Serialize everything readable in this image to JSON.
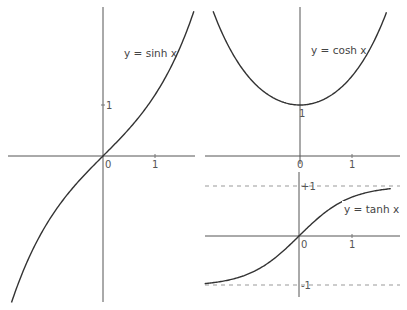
{
  "panels": {
    "sinh": {
      "label": "y = sinh x",
      "origin_label": "0",
      "x_tick_label": "1",
      "y_tick_label": "1",
      "curve_color": "#333333"
    },
    "cosh": {
      "label": "y = cosh x",
      "origin_label": "0",
      "x_tick_label": "1",
      "y_tick_label": "1",
      "curve_color": "#333333"
    },
    "tanh": {
      "label": "y = tanh x",
      "origin_label": "0",
      "x_tick_label": "1",
      "upper_asymptote_label": "+1",
      "lower_asymptote_label": "-1",
      "curve_color": "#333333"
    }
  },
  "chart_data": [
    {
      "type": "line",
      "title": "y = sinh x",
      "function": "sinh",
      "x_range": [
        -1.85,
        1.77
      ],
      "y_range": [
        -2.8,
        2.8
      ],
      "x_ticks": [
        0,
        1
      ],
      "y_ticks": [
        1
      ],
      "grid": false
    },
    {
      "type": "line",
      "title": "y = cosh x",
      "function": "cosh",
      "x_range": [
        -1.75,
        1.95
      ],
      "y_min": 1,
      "x_ticks": [
        0,
        1
      ],
      "y_ticks": [
        1
      ],
      "grid": false
    },
    {
      "type": "line",
      "title": "y = tanh x",
      "function": "tanh",
      "x_range": [
        -1.85,
        1.8
      ],
      "asymptotes": [
        1,
        -1
      ],
      "x_ticks": [
        0,
        1
      ],
      "y_ticks": [
        1,
        -1
      ],
      "grid": false
    }
  ]
}
